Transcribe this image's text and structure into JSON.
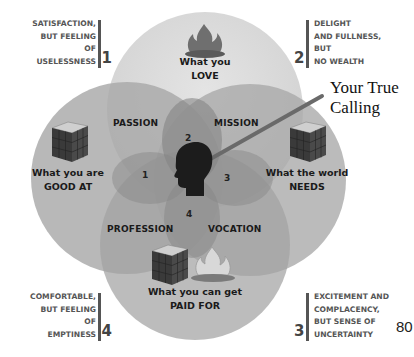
{
  "circles": {
    "love": {
      "line1": "What you",
      "line2": "LOVE",
      "icon": "campfire-icon"
    },
    "good_at": {
      "line1": "What you are",
      "line2": "GOOD AT",
      "icon": "rubiks-cube-icon"
    },
    "world_needs": {
      "line1": "What the world",
      "line2": "NEEDS",
      "icon": "rubiks-cube-icon"
    },
    "paid_for": {
      "line1": "What you can get",
      "line2": "PAID FOR",
      "icons": [
        "rubiks-cube-icon",
        "campfire-icon"
      ]
    }
  },
  "regions": {
    "passion": "PASSION",
    "mission": "MISSION",
    "profession": "PROFESSION",
    "vocation": "VOCATION"
  },
  "inner_numbers": {
    "n1": "1",
    "n2": "2",
    "n3": "3",
    "n4": "4"
  },
  "center": {
    "icon": "head-silhouette-icon",
    "callout": {
      "line1": "Your True",
      "line2": "Calling"
    }
  },
  "corners": {
    "top_left": {
      "lines": [
        "SATISFACTION,",
        "BUT FEELING",
        "OF",
        "USELESSNESS"
      ],
      "number": "1"
    },
    "top_right": {
      "lines": [
        "DELIGHT",
        "AND FULLNESS,",
        "BUT",
        "NO WEALTH"
      ],
      "number": "2"
    },
    "bottom_left": {
      "lines": [
        "COMFORTABLE,",
        "BUT FEELING",
        "OF",
        "EMPTINESS"
      ],
      "number": "4"
    },
    "bottom_right": {
      "lines": [
        "EXCITEMENT AND",
        "COMPLACENCY,",
        "BUT SENSE OF",
        "UNCERTAINTY"
      ],
      "number": "3"
    }
  },
  "page_number": "80",
  "colors": {
    "circle_fill": "#9e9e9e",
    "top_circle_fill": "#d6d6d6",
    "text_dark": "#1a1a1a",
    "text_grey": "#555555"
  }
}
